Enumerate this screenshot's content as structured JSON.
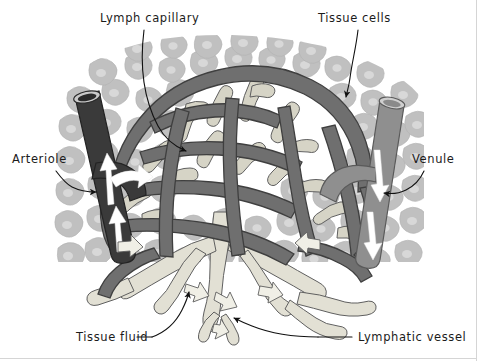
{
  "figure": {
    "width": 477,
    "height": 361,
    "background_color": "#ffffff"
  },
  "labels": [
    {
      "id": "lymph-capillary",
      "text": "Lymph capillary",
      "x": 100,
      "y": 22,
      "anchor": "start",
      "leader": "curved-arrow",
      "points_to": "lymph capillary branch inside network"
    },
    {
      "id": "tissue-cells",
      "text": "Tissue cells",
      "x": 318,
      "y": 22,
      "anchor": "start",
      "leader": "curved-arrow",
      "points_to": "tissue cell at upper right"
    },
    {
      "id": "arteriole",
      "text": "Arteriole",
      "x": 12,
      "y": 163,
      "anchor": "start",
      "leader": "curved-arrow",
      "points_to": "dark vessel at left"
    },
    {
      "id": "venule",
      "text": "Venule",
      "x": 412,
      "y": 163,
      "anchor": "start",
      "leader": "curved-arrow",
      "points_to": "grey vessel at right"
    },
    {
      "id": "tissue-fluid",
      "text": "Tissue fluid",
      "x": 76,
      "y": 341,
      "anchor": "start",
      "leader": "dash-plus-curve",
      "points_to": "pale fluid space between cells"
    },
    {
      "id": "lymphatic-vessel",
      "text": "Lymphatic vessel",
      "x": 358,
      "y": 341,
      "anchor": "start",
      "leader": "straight-plus-arrow",
      "points_to": "pale vessel at bottom centre"
    }
  ],
  "colors": {
    "tissue_cell": "#c0c0c0",
    "tissue_cell_nucleus": "#d8d8d8",
    "blood_capillary_network": "#6f6f6f",
    "blood_capillary_outline": "#3f3f3f",
    "lymph_vessel_pale": "#e2e0d4",
    "lymph_vessel_outline": "#5f5f5f",
    "arteriole": "#3a3a3a",
    "venule": "#8f8f8f",
    "flow_arrow": "#ffffff",
    "label_text": "#1b1b1b",
    "leader_line": "#111111",
    "background": "#ffffff"
  },
  "structures": [
    {
      "name": "arteriole",
      "description": "dark near-black tube entering from upper left with white arrows showing blood flow into the capillary bed"
    },
    {
      "name": "venule",
      "description": "medium grey tube leaving at right with white arrows showing blood flow away from the capillary bed"
    },
    {
      "name": "blood-capillary-network",
      "description": "dark grey anastomosing mesh arching across the centre of the field"
    },
    {
      "name": "lymph-capillaries",
      "description": "pale cream blind-ended tubes woven through the blood capillary mesh"
    },
    {
      "name": "lymphatic-vessel",
      "description": "larger pale vessel draining downward from the lymph capillaries"
    },
    {
      "name": "tissue-cells",
      "description": "light grey irregular polygonal cells with paler nuclei filling the background"
    },
    {
      "name": "tissue-fluid",
      "description": "pale space surrounding the cells, drained by the lymph capillaries"
    }
  ],
  "flow_arrows": [
    {
      "vessel": "arteriole",
      "direction": "up-then-right",
      "count": 3
    },
    {
      "vessel": "venule",
      "direction": "down",
      "count": 2
    },
    {
      "vessel": "lymphatic",
      "direction": "down-and-outward",
      "count": 6
    }
  ]
}
